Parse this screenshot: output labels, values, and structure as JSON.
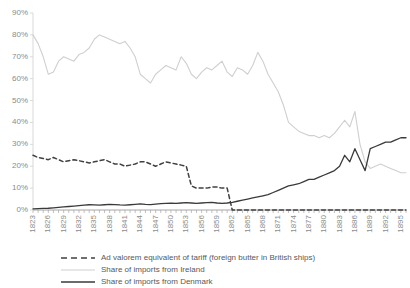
{
  "chart_data": {
    "type": "line",
    "title": "",
    "xlabel": "",
    "ylabel": "",
    "ylim": [
      0,
      90
    ],
    "ytick_labels": [
      "0%",
      "10%",
      "20%",
      "30%",
      "40%",
      "50%",
      "60%",
      "70%",
      "80%",
      "90%"
    ],
    "ytick_values": [
      0,
      10,
      20,
      30,
      40,
      50,
      60,
      70,
      80,
      90
    ],
    "grid": false,
    "legend_position": "bottom",
    "x": [
      1823,
      1824,
      1825,
      1826,
      1827,
      1828,
      1829,
      1830,
      1831,
      1832,
      1833,
      1834,
      1835,
      1836,
      1837,
      1838,
      1839,
      1840,
      1841,
      1842,
      1843,
      1844,
      1845,
      1846,
      1847,
      1848,
      1849,
      1850,
      1851,
      1852,
      1853,
      1854,
      1855,
      1856,
      1857,
      1858,
      1859,
      1860,
      1861,
      1862,
      1863,
      1864,
      1865,
      1866,
      1867,
      1868,
      1869,
      1870,
      1871,
      1872,
      1873,
      1874,
      1875,
      1876,
      1877,
      1878,
      1879,
      1880,
      1881,
      1882,
      1883,
      1884,
      1885,
      1886,
      1887,
      1888,
      1889,
      1890,
      1891,
      1892,
      1893,
      1894,
      1895,
      1896
    ],
    "xtick_labels": [
      "1823",
      "1826",
      "1829",
      "1832",
      "1835",
      "1838",
      "1841",
      "1844",
      "1847",
      "1850",
      "1853",
      "1856",
      "1859",
      "1862",
      "1865",
      "1868",
      "1871",
      "1874",
      "1877",
      "1880",
      "1883",
      "1886",
      "1889",
      "1892",
      "1895"
    ],
    "series": [
      {
        "name": "Ad valorem equivalent of tariff (foreign butter in British ships)",
        "style": "dashed",
        "color": "#404040",
        "values": [
          25,
          24,
          23.5,
          23,
          24,
          23,
          22,
          22.5,
          23,
          22.5,
          22,
          21.5,
          22,
          22.5,
          23,
          22,
          21,
          21,
          20,
          20.5,
          21,
          22,
          22,
          21,
          20,
          21,
          22,
          21.5,
          21,
          20.5,
          20,
          11,
          10,
          10,
          10,
          10.5,
          10.5,
          10,
          10,
          0,
          0,
          0,
          0,
          0,
          0,
          0,
          0,
          0,
          0,
          0,
          0,
          0,
          0,
          0,
          0,
          0,
          0,
          0,
          0,
          0,
          0,
          0,
          0,
          0,
          0,
          0,
          0,
          0,
          0,
          0,
          0,
          0,
          0,
          0
        ]
      },
      {
        "name": "Share of imports from Ireland",
        "style": "solid",
        "color": "#cfcfcf",
        "values": [
          80,
          76,
          70,
          62,
          63,
          68,
          70,
          69,
          68,
          71,
          72,
          74,
          78,
          80,
          79,
          78,
          77,
          76,
          77,
          74,
          70,
          62,
          60,
          58,
          62,
          64,
          66,
          65,
          64,
          70,
          67,
          62,
          60,
          63,
          65,
          64,
          66,
          68,
          63,
          61,
          65,
          64,
          62,
          66,
          72,
          68,
          62,
          58,
          54,
          48,
          40,
          38,
          36,
          35,
          34,
          34,
          33,
          34,
          33,
          35,
          38,
          41,
          38,
          45,
          30,
          22,
          19,
          20,
          21,
          20,
          19,
          18,
          17,
          17
        ]
      },
      {
        "name": "Share of imports from Denmark",
        "style": "solid",
        "color": "#3a3a3a",
        "values": [
          0.5,
          0.6,
          0.7,
          0.8,
          1,
          1.2,
          1.4,
          1.6,
          1.8,
          2,
          2.2,
          2.4,
          2.3,
          2.2,
          2.4,
          2.6,
          2.5,
          2.3,
          2.2,
          2.4,
          2.6,
          2.8,
          2.6,
          2.5,
          2.7,
          2.9,
          3,
          3.1,
          3,
          3.2,
          3.4,
          3.2,
          3,
          3.2,
          3.4,
          3.5,
          3.2,
          3,
          3.2,
          3.5,
          4,
          4.5,
          5,
          5.5,
          6,
          6.5,
          7,
          8,
          9,
          10,
          11,
          11.5,
          12,
          13,
          14,
          14,
          15,
          16,
          17,
          18,
          20,
          25,
          22,
          28,
          23,
          18,
          28,
          29,
          30,
          31,
          31,
          32,
          33,
          33
        ]
      }
    ]
  },
  "legend": {
    "items": [
      {
        "label": "Ad valorem equivalent of tariff (foreign butter in British ships)",
        "icon": "dashed-line-icon"
      },
      {
        "label": "Share of imports from Ireland",
        "icon": "light-line-icon"
      },
      {
        "label": "Share of imports from Denmark",
        "icon": "dark-line-icon"
      }
    ]
  }
}
